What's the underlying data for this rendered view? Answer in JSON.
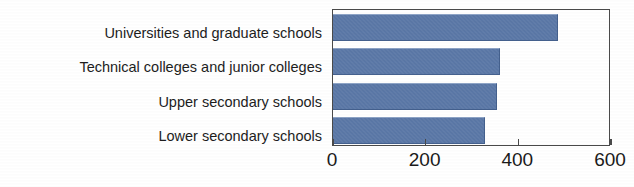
{
  "figure": {
    "panel_caption": "Panel 2.",
    "background_color": "#ffffff"
  },
  "chart_data": {
    "type": "bar",
    "orientation": "horizontal",
    "title": "Panel 2.",
    "xlabel": "",
    "ylabel": "",
    "categories": [
      "Universities and graduate schools",
      "Technical colleges and junior colleges",
      "Upper secondary schools",
      "Lower secondary schools"
    ],
    "values": [
      485,
      360,
      355,
      327
    ],
    "xlim": [
      0,
      600
    ],
    "xticks": [
      0,
      200,
      400,
      600
    ],
    "xtick_labels": [
      "0",
      "200",
      "400",
      "600"
    ],
    "grid": false,
    "legend": false,
    "legend_position": "none",
    "series": [
      {
        "name": "value",
        "values": [
          485,
          360,
          355,
          327
        ],
        "color": "#5a77a6"
      }
    ],
    "bar_color": "#5a77a6",
    "axis_color": "#4a4a4a"
  },
  "axis": {
    "ticks": [
      {
        "label": "0",
        "value": 0
      },
      {
        "label": "200",
        "value": 200
      },
      {
        "label": "400",
        "value": 400
      },
      {
        "label": "600",
        "value": 600
      }
    ]
  }
}
